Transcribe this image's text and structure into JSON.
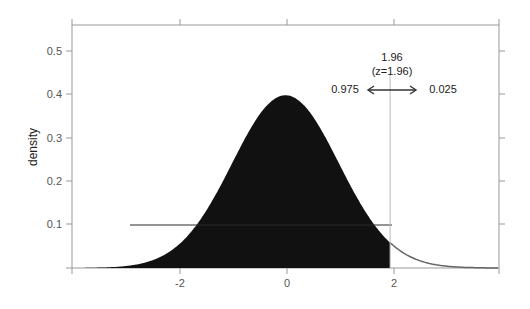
{
  "chart_data": {
    "type": "area",
    "title": "",
    "xlabel": "",
    "ylabel": "density",
    "xlim": [
      -4,
      4
    ],
    "ylim": [
      0,
      0.56
    ],
    "grid": false,
    "legend": null,
    "x_ticks": [
      -2,
      0,
      2
    ],
    "x_tick_labels": [
      "-2",
      "0",
      "2"
    ],
    "y_ticks": [
      0.1,
      0.2,
      0.3,
      0.4,
      0.5
    ],
    "y_tick_labels": [
      "0.1",
      "0.2",
      "0.3",
      "0.4",
      "0.5"
    ],
    "series": [
      {
        "name": "standard normal density",
        "distribution": "normal",
        "mean": 0,
        "sd": 1,
        "peak": 0.399,
        "shaded_region": {
          "from": -4,
          "to": 1.96,
          "color": "#111111"
        },
        "unshaded_line_color": "#666666"
      }
    ],
    "annotations": {
      "cutoff_value": "1.96",
      "cutoff_z": "(z=1.96)",
      "cutoff_x": 1.96,
      "left_area": "0.975",
      "right_area": "0.025"
    }
  },
  "colors": {
    "fill": "#111111",
    "axis": "#888888",
    "cutoff_line": "#bbbbbb",
    "text": "#222222"
  }
}
